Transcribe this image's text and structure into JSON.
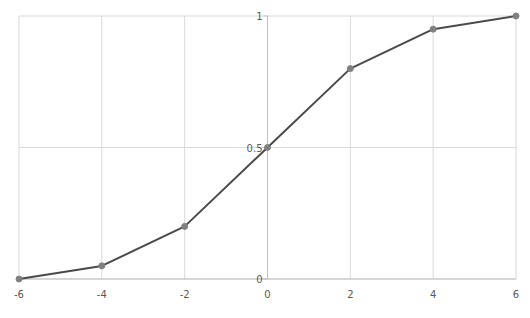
{
  "chart_data": {
    "type": "line",
    "title": "",
    "xlabel": "",
    "ylabel": "",
    "x": [
      -6,
      -4,
      -2,
      0,
      2,
      4,
      6
    ],
    "series": [
      {
        "name": "Series1",
        "values": [
          0,
          0.05,
          0.2,
          0.5,
          0.8,
          0.95,
          1
        ]
      }
    ],
    "xlim": [
      -6,
      6
    ],
    "ylim": [
      0,
      1
    ],
    "x_ticks": [
      -6,
      -4,
      -2,
      0,
      2,
      4,
      6
    ],
    "x_tick_labels": [
      "-6",
      "-4",
      "-2",
      "0",
      "2",
      "4",
      "6"
    ],
    "y_ticks": [
      0,
      0.5,
      1
    ],
    "y_tick_labels": [
      "0",
      "0.5",
      "1"
    ],
    "grid": true,
    "legend": null,
    "markers": true
  },
  "colors": {
    "line": "#4a4a4a",
    "marker": "#808080",
    "grid": "#d9d9d9",
    "axis": "#bfbfbf",
    "tick_text": "#595959"
  }
}
